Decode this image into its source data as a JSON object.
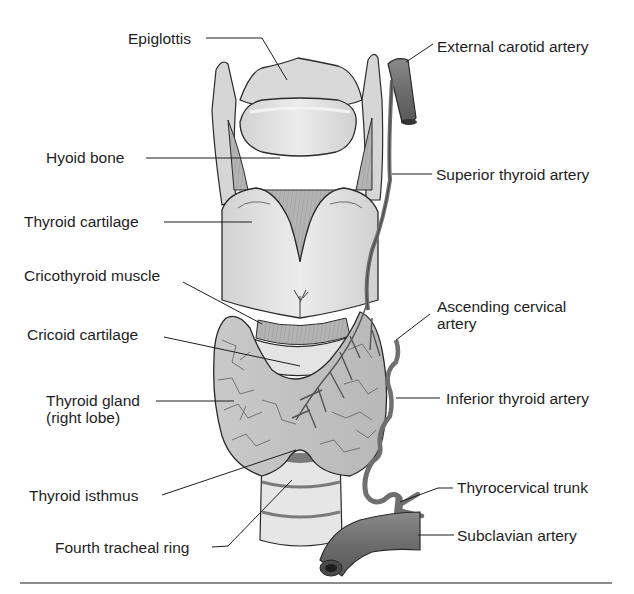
{
  "figure": {
    "colors": {
      "cartilage": "#dcdcdc",
      "cartilage_light": "#ebebeb",
      "muscle": "#a9a9a9",
      "gland": "#c4c4c4",
      "artery": "#7a7a7a",
      "outline": "#2a2a2a",
      "divider": "#8c8c8c"
    }
  },
  "labels": {
    "left": [
      {
        "id": "epiglottis",
        "text": "Epiglottis"
      },
      {
        "id": "hyoid_bone",
        "text": "Hyoid bone"
      },
      {
        "id": "thyroid_cartilage",
        "text": "Thyroid cartilage"
      },
      {
        "id": "cricothyroid_muscle",
        "text": "Cricothyroid muscle"
      },
      {
        "id": "cricoid_cartilage",
        "text": "Cricoid cartilage"
      },
      {
        "id": "thyroid_gland",
        "text": "Thyroid gland",
        "text2": "(right lobe)"
      },
      {
        "id": "thyroid_isthmus",
        "text": "Thyroid isthmus"
      },
      {
        "id": "fourth_tracheal_ring",
        "text": "Fourth tracheal ring"
      }
    ],
    "right": [
      {
        "id": "external_carotid_artery",
        "text": "External carotid artery"
      },
      {
        "id": "superior_thyroid_artery",
        "text": "Superior thyroid artery"
      },
      {
        "id": "ascending_cervical_artery",
        "text": "Ascending cervical",
        "text2": "artery"
      },
      {
        "id": "inferior_thyroid_artery",
        "text": "Inferior thyroid artery"
      },
      {
        "id": "thyrocervical_trunk",
        "text": "Thyrocervical trunk"
      },
      {
        "id": "subclavian_artery",
        "text": "Subclavian artery"
      }
    ]
  }
}
